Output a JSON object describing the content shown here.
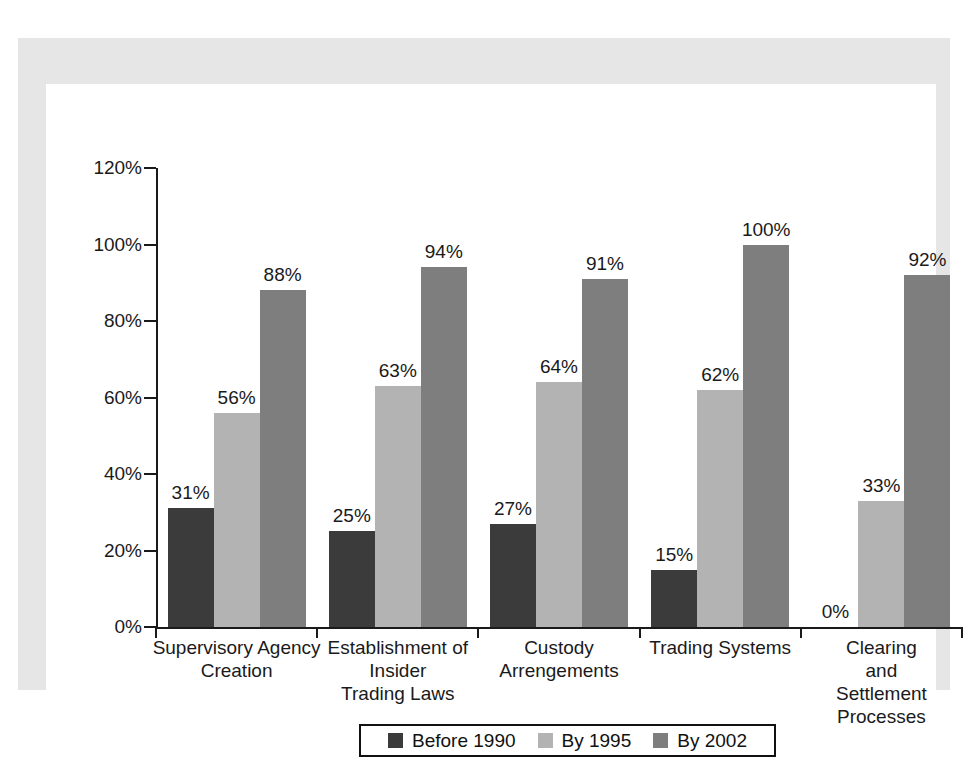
{
  "chart_data": {
    "type": "bar",
    "title": "",
    "subtitle": "",
    "xlabel": "",
    "ylabel": "",
    "ylim": [
      0,
      120
    ],
    "ytick_labels": [
      "0%",
      "20%",
      "40%",
      "60%",
      "80%",
      "100%",
      "120%"
    ],
    "ytick_values": [
      0,
      20,
      40,
      60,
      80,
      100,
      120
    ],
    "grid": false,
    "legend_position": "bottom",
    "value_suffix": "%",
    "categories": [
      "Supervisory Agency Creation",
      "Establishment of Insider Trading Laws",
      "Custody Arrengements",
      "Trading Systems",
      "Clearing and Settlement Processes"
    ],
    "category_lines": [
      [
        "Supervisory Agency",
        "Creation"
      ],
      [
        "Establishment of",
        "Insider",
        "Trading Laws"
      ],
      [
        "Custody",
        "Arrengements"
      ],
      [
        "Trading Systems"
      ],
      [
        "Clearing and",
        "Settlement",
        "Processes"
      ]
    ],
    "series": [
      {
        "name": "Before 1990",
        "color": "#3b3b3b",
        "values": [
          31,
          25,
          27,
          15,
          0
        ],
        "labels": [
          "31%",
          "25%",
          "27%",
          "15%",
          "0%"
        ]
      },
      {
        "name": "By 1995",
        "color": "#b3b3b3",
        "values": [
          56,
          63,
          64,
          62,
          33
        ],
        "labels": [
          "56%",
          "63%",
          "64%",
          "62%",
          "33%"
        ]
      },
      {
        "name": "By 2002",
        "color": "#7e7e7e",
        "values": [
          88,
          94,
          91,
          100,
          92
        ],
        "labels": [
          "88%",
          "94%",
          "91%",
          "100%",
          "92%"
        ]
      }
    ]
  },
  "colors": {
    "page_background": "#ffffff",
    "panel_background": "#e6e6e6",
    "plot_background": "#ffffff",
    "axis": "#1a1a1a",
    "text": "#1a1a1a",
    "legend_border": "#111111"
  }
}
